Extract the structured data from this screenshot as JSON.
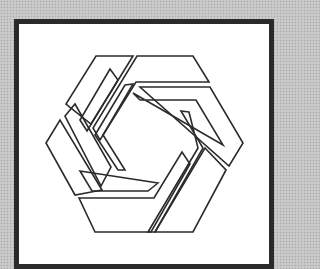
{
  "image": {
    "description": "Hexagonal pinwheel logo made of six outlined blades inside a dark square frame",
    "background_color": "#c4c4c4",
    "frame_border_color": "#2a2a2a",
    "frame_fill_color": "#ffffff",
    "stroke_color": "#2b2b2b"
  },
  "logo": {
    "shape": "hexagon-pinwheel",
    "blade_count": 6,
    "icon": "hexagon-pinwheel-icon"
  }
}
